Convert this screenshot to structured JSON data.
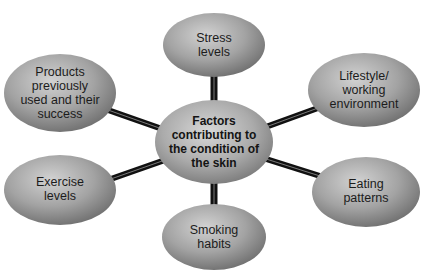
{
  "diagram": {
    "type": "mind-map",
    "colors": {
      "connector": "#111111",
      "connector_highlight": "#8a8a8a",
      "node_light": "#c9c9c9",
      "node_mid": "#9a9a9a",
      "node_dark": "#6e6e6e",
      "text": "#1c1c1c"
    },
    "center": {
      "label": "Factors\ncontributing to\nthe condition of\nthe skin"
    },
    "nodes": [
      {
        "id": "stress",
        "label": "Stress\nlevels"
      },
      {
        "id": "lifestyle",
        "label": "Lifestyle/\nworking\nenvironment"
      },
      {
        "id": "eating",
        "label": "Eating\npatterns"
      },
      {
        "id": "smoking",
        "label": "Smoking\nhabits"
      },
      {
        "id": "exercise",
        "label": "Exercise\nlevels"
      },
      {
        "id": "products",
        "label": "Products\npreviously\nused and their\nsuccess"
      }
    ]
  }
}
